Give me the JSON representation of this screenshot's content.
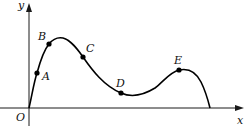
{
  "diagram": {
    "type": "function-curve",
    "axes": {
      "x_label": "x",
      "y_label": "y",
      "origin_label": "O",
      "color": "#1a1a1a"
    },
    "points": [
      {
        "id": "A",
        "label": "A"
      },
      {
        "id": "B",
        "label": "B"
      },
      {
        "id": "C",
        "label": "C"
      },
      {
        "id": "D",
        "label": "D"
      },
      {
        "id": "E",
        "label": "E"
      }
    ],
    "curve_color": "#000000"
  }
}
